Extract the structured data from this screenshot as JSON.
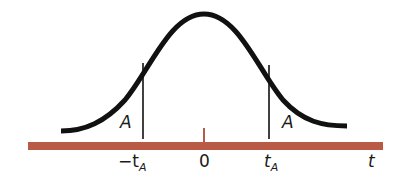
{
  "diagram": {
    "type": "symmetric bell curve (t-distribution) with two-tailed critical values",
    "colors": {
      "curve": "#111111",
      "axis": "#b85a45",
      "lines": "#111111",
      "text": "#1a1a1a"
    },
    "axis_label": "t",
    "tick_labels": {
      "left": {
        "main": "−t",
        "sub": "A"
      },
      "center": "0",
      "right": {
        "main": "t",
        "sub": "A"
      }
    },
    "region_labels": {
      "left_tail": "A",
      "right_tail": "A"
    }
  }
}
